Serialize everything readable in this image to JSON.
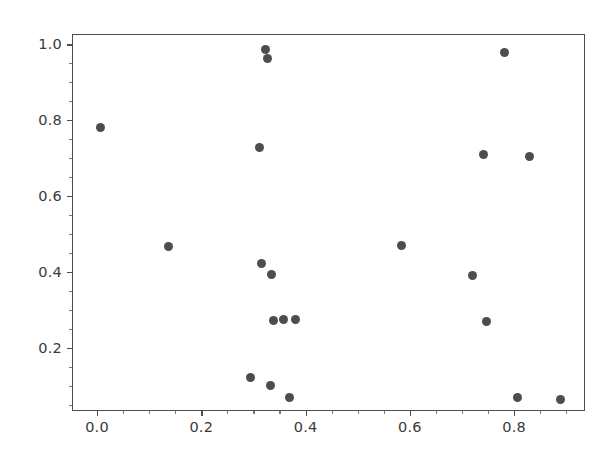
{
  "figure": {
    "width": 614,
    "height": 466,
    "background": "#ffffff"
  },
  "chart_data": {
    "type": "scatter",
    "title": "",
    "xlabel": "",
    "ylabel": "",
    "xlim": [
      -0.048,
      0.936
    ],
    "ylim": [
      0.034,
      1.027
    ],
    "grid": false,
    "legend": null,
    "marker": {
      "shape": "circle",
      "color": "#4d4d4d",
      "size_px": 9
    },
    "xticks": [
      0.0,
      0.2,
      0.4,
      0.6,
      0.8
    ],
    "xticklabels": [
      "0.0",
      "0.2",
      "0.4",
      "0.6",
      "0.8"
    ],
    "yticks": [
      0.2,
      0.4,
      0.6,
      0.8,
      1.0
    ],
    "yticklabels": [
      "0.2",
      "0.4",
      "0.6",
      "0.8",
      "1.0"
    ],
    "x_minor_ticks": [
      0.05,
      0.1,
      0.15,
      0.25,
      0.3,
      0.35,
      0.45,
      0.5,
      0.55,
      0.65,
      0.7,
      0.75,
      0.85,
      0.9
    ],
    "y_minor_ticks": [
      0.05,
      0.1,
      0.15,
      0.25,
      0.3,
      0.35,
      0.45,
      0.5,
      0.55,
      0.65,
      0.7,
      0.75,
      0.85,
      0.9,
      0.95,
      1.0
    ],
    "n_points": 21,
    "x": [
      0.005,
      0.135,
      0.292,
      0.31,
      0.313,
      0.322,
      0.325,
      0.331,
      0.332,
      0.336,
      0.355,
      0.368,
      0.379,
      0.583,
      0.718,
      0.74,
      0.745,
      0.78,
      0.805,
      0.828,
      0.888
    ],
    "y": [
      0.784,
      0.47,
      0.124,
      0.73,
      0.425,
      0.99,
      0.966,
      0.104,
      0.395,
      0.275,
      0.277,
      0.073,
      0.277,
      0.473,
      0.394,
      0.713,
      0.273,
      0.982,
      0.071,
      0.706,
      0.066
    ],
    "points": [
      {
        "x": 0.005,
        "y": 0.784
      },
      {
        "x": 0.135,
        "y": 0.47
      },
      {
        "x": 0.292,
        "y": 0.124
      },
      {
        "x": 0.31,
        "y": 0.73
      },
      {
        "x": 0.313,
        "y": 0.425
      },
      {
        "x": 0.322,
        "y": 0.99
      },
      {
        "x": 0.325,
        "y": 0.966
      },
      {
        "x": 0.331,
        "y": 0.104
      },
      {
        "x": 0.332,
        "y": 0.395
      },
      {
        "x": 0.336,
        "y": 0.275
      },
      {
        "x": 0.355,
        "y": 0.277
      },
      {
        "x": 0.368,
        "y": 0.073
      },
      {
        "x": 0.379,
        "y": 0.277
      },
      {
        "x": 0.583,
        "y": 0.473
      },
      {
        "x": 0.718,
        "y": 0.394
      },
      {
        "x": 0.74,
        "y": 0.713
      },
      {
        "x": 0.745,
        "y": 0.273
      },
      {
        "x": 0.78,
        "y": 0.982
      },
      {
        "x": 0.805,
        "y": 0.071
      },
      {
        "x": 0.828,
        "y": 0.706
      },
      {
        "x": 0.888,
        "y": 0.066
      }
    ]
  }
}
